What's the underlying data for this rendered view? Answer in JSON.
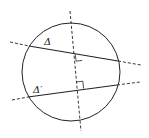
{
  "diagram": {
    "colors": {
      "stroke": "#222222",
      "background": "#ffffff"
    },
    "labels": {
      "line1": "Δ",
      "line2": "Δ′"
    },
    "circle": {
      "cx": 71,
      "cy": 72,
      "r": 49
    },
    "perpendicular_axis": {
      "x1": 70,
      "y1": 11,
      "x2": 81,
      "y2": 131,
      "style": "dashed"
    },
    "lines": [
      {
        "name": "Δ",
        "chord": {
          "x1": 29,
          "y1": 46,
          "x2": 118,
          "y2": 61
        },
        "ext_left": {
          "x1": 10,
          "y1": 42
        },
        "ext_right": {
          "x2": 141,
          "y2": 65
        }
      },
      {
        "name": "Δ′",
        "chord": {
          "x1": 28,
          "y1": 97,
          "x2": 117,
          "y2": 85
        },
        "ext_left": {
          "x1": 12,
          "y1": 100
        },
        "ext_right": {
          "x2": 140,
          "y2": 82
        }
      }
    ],
    "right_angle_marks": 2
  }
}
